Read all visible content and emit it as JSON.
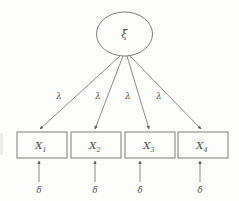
{
  "figure": {
    "kind": "path-diagram",
    "background_color": "#fdfdfc",
    "line_color": "#76767a",
    "glyph_color": "#4a4a4c"
  },
  "latent": {
    "label": "ξ",
    "shape": "ellipse",
    "cx": 124.5,
    "cy": 34,
    "rx": 28,
    "ry": 22
  },
  "indicators": [
    {
      "label": "X",
      "subscript": "1",
      "x": 17,
      "y": 132,
      "w": 50,
      "h": 26,
      "cx": 42
    },
    {
      "label": "X",
      "subscript": "2",
      "x": 71,
      "y": 132,
      "w": 50,
      "h": 26,
      "cx": 96
    },
    {
      "label": "X",
      "subscript": "3",
      "x": 125,
      "y": 132,
      "w": 50,
      "h": 26,
      "cx": 150
    },
    {
      "label": "X",
      "subscript": "4",
      "x": 178,
      "y": 132,
      "w": 50,
      "h": 26,
      "cx": 203
    }
  ],
  "loadings": [
    {
      "label": "λ",
      "lx": 59,
      "ly": 99,
      "x1": 120,
      "y1": 56,
      "x2": 40,
      "y2": 129
    },
    {
      "label": "λ",
      "lx": 98,
      "ly": 99,
      "x1": 123,
      "y1": 56,
      "x2": 95,
      "y2": 129
    },
    {
      "label": "λ",
      "lx": 128,
      "ly": 99,
      "x1": 127,
      "y1": 56,
      "x2": 149,
      "y2": 129
    },
    {
      "label": "λ",
      "lx": 159,
      "ly": 99,
      "x1": 130,
      "y1": 56,
      "x2": 201,
      "y2": 129
    }
  ],
  "errors": [
    {
      "label": "δ",
      "lx": 39,
      "ly": 191,
      "x": 39,
      "y1": 182,
      "y2": 161
    },
    {
      "label": "δ",
      "lx": 95,
      "ly": 191,
      "x": 95,
      "y1": 182,
      "y2": 161
    },
    {
      "label": "δ",
      "lx": 140,
      "ly": 191,
      "x": 140,
      "y1": 182,
      "y2": 161
    },
    {
      "label": "δ",
      "lx": 200,
      "ly": 191,
      "x": 200,
      "y1": 182,
      "y2": 161
    }
  ]
}
